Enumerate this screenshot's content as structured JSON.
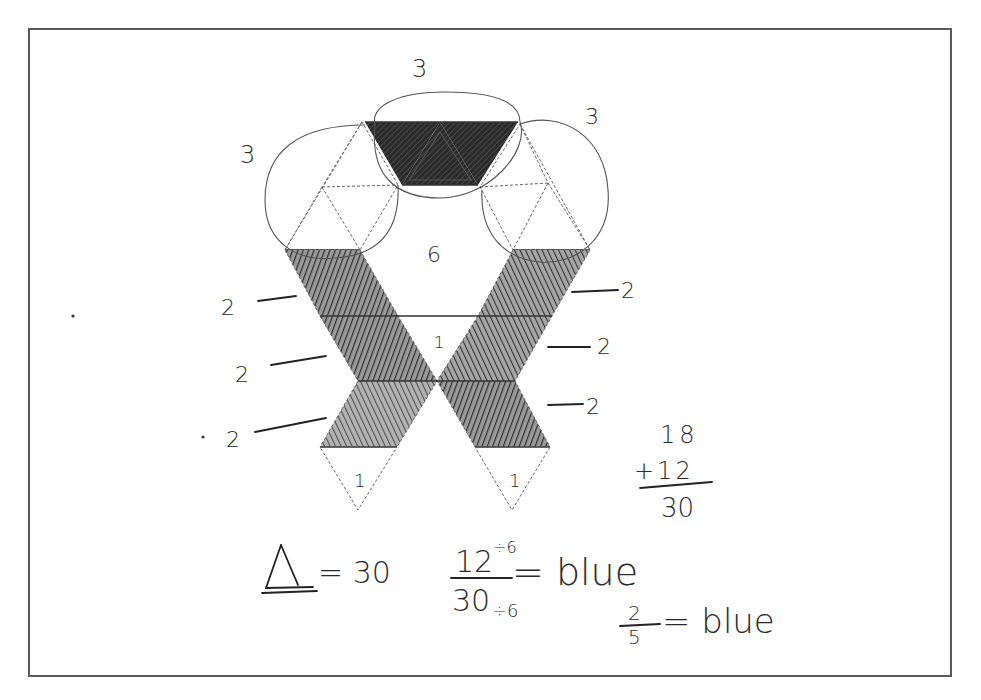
{
  "sheet": {
    "border_color": "#5a5a5a",
    "background": "#ffffff"
  },
  "net": {
    "region_labels": {
      "top_group": "3",
      "left_group": "3",
      "right_group": "3",
      "center": "6",
      "crossing": "1",
      "left_bottom_triangle": "1",
      "right_bottom_triangle": "1"
    },
    "left_strip_labels": [
      "2",
      "2",
      "2"
    ],
    "right_strip_labels": [
      "2",
      "2",
      "2"
    ],
    "shade_color": "#3a3a3a"
  },
  "sum": {
    "addend1": "18",
    "addend2": "+12",
    "total": "30"
  },
  "equations": {
    "triangle_eq": "= 30",
    "fraction_numerator": "12",
    "numerator_divisor": "÷6",
    "fraction_denominator": "30",
    "denominator_divisor": "÷6",
    "fraction_result": "= blue",
    "simplified_numerator": "2",
    "simplified_denominator": "5",
    "simplified_result": "= blue"
  }
}
